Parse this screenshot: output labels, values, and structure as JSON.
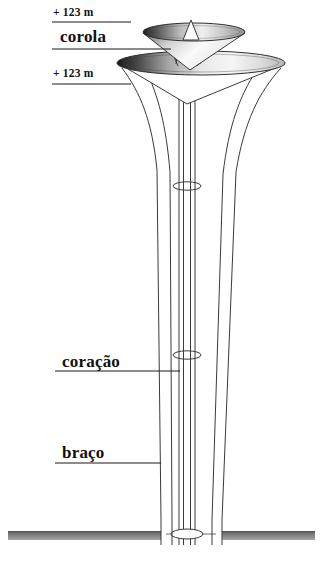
{
  "figure": {
    "background_color": "#ffffff",
    "line_color": "#3a3a3a",
    "text_color": "#111111",
    "ground_fill_color": "#9a9a9a",
    "ground_top_color": "#5a5a5a",
    "shade_dark_color": "#2b2b2b",
    "shade_light_color": "#f2f2f2"
  },
  "labels": {
    "elevation_top": "+ 123 m",
    "corola": "corola",
    "elevation_mid": "+ 123 m",
    "coracao": "coração",
    "braco": "braço"
  },
  "caption": {
    "clipped_text": ""
  },
  "annotations": [
    {
      "name": "elevation-top",
      "text": "+ 123 m",
      "leader_y": 22
    },
    {
      "name": "corola",
      "text": "corola",
      "leader_y": 49
    },
    {
      "name": "elevation-mid",
      "text": "+ 123 m",
      "leader_y": 84
    },
    {
      "name": "coracao",
      "text": "coração",
      "leader_y": 371
    },
    {
      "name": "braco",
      "text": "braço",
      "leader_y": 463
    }
  ],
  "structure": {
    "upper_corola": {
      "name": "upper-corola",
      "center_x": 194,
      "center_y": 32,
      "rx": 51,
      "ry": 9
    },
    "lower_corola": {
      "name": "lower-corola",
      "center_x": 201,
      "center_y": 64,
      "rx": 84,
      "ry": 12
    },
    "mast": {
      "name": "mast-spire",
      "apex_x": 191,
      "apex_y": 20
    },
    "core_rings": [
      {
        "name": "core-ring-upper",
        "center_x": 187,
        "center_y": 186,
        "rx": 14,
        "ry": 4
      },
      {
        "name": "core-ring-lower",
        "center_x": 187,
        "center_y": 355,
        "rx": 14,
        "ry": 4
      },
      {
        "name": "core-ring-base",
        "center_x": 187,
        "center_y": 534,
        "rx": 16,
        "ry": 5
      }
    ],
    "ground": {
      "name": "ground-line",
      "y": 531,
      "height": 9
    }
  }
}
